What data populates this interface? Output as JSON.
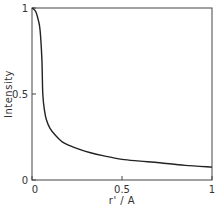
{
  "chart_data": {
    "type": "line",
    "title": "",
    "xlabel": "r' / A",
    "ylabel": "Intensity",
    "xlim": [
      0,
      1
    ],
    "ylim": [
      0,
      1
    ],
    "grid": false,
    "legend": null,
    "x_ticks": [
      {
        "value": 0,
        "label": "0"
      },
      {
        "value": 0.5,
        "label": "0.5"
      },
      {
        "value": 1,
        "label": "1"
      }
    ],
    "y_ticks": [
      {
        "value": 0,
        "label": "0"
      },
      {
        "value": 0.5,
        "label": "0.5"
      },
      {
        "value": 1,
        "label": "1"
      }
    ],
    "series": [
      {
        "name": "Intensity",
        "color": "#222222",
        "x": [
          0,
          0.02,
          0.035,
          0.045,
          0.055,
          0.06,
          0.07,
          0.08,
          0.1,
          0.13,
          0.17,
          0.21,
          0.26,
          0.32,
          0.4,
          0.5,
          0.6,
          0.71,
          0.85,
          1.0
        ],
        "y": [
          1.0,
          0.98,
          0.93,
          0.87,
          0.7,
          0.5,
          0.4,
          0.35,
          0.3,
          0.26,
          0.22,
          0.2,
          0.18,
          0.16,
          0.14,
          0.12,
          0.11,
          0.1,
          0.085,
          0.075
        ]
      }
    ]
  }
}
